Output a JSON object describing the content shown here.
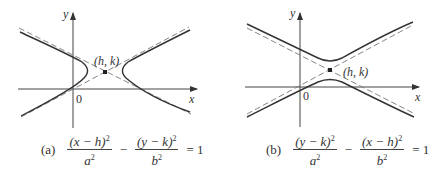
{
  "figures": [
    {
      "id": "a",
      "tag": "(a)",
      "axis_x_label": "x",
      "axis_y_label": "y",
      "origin_label": "0",
      "center_label": "(h, k)",
      "orientation": "horizontal transverse axis",
      "equation": {
        "term1_num": "(x − h)",
        "term1_den": "a",
        "operator": "−",
        "term2_num": "(y − k)",
        "term2_den": "b",
        "exponent": "2",
        "rhs": "= 1"
      }
    },
    {
      "id": "b",
      "tag": "(b)",
      "axis_x_label": "x",
      "axis_y_label": "y",
      "origin_label": "0",
      "center_label": "(h, k)",
      "orientation": "vertical transverse axis",
      "equation": {
        "term1_num": "(y − k)",
        "term1_den": "a",
        "operator": "−",
        "term2_num": "(x − h)",
        "term2_den": "b",
        "exponent": "2",
        "rhs": "= 1"
      }
    }
  ],
  "colors": {
    "curve": "#3a3a3a",
    "asymptote": "#7a7a7a",
    "axis": "#444444"
  }
}
